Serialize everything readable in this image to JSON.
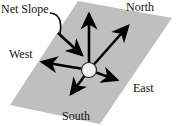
{
  "diagram": {
    "type": "vector-diagram",
    "plane": {
      "name": "sloped-plane-parallelogram",
      "fill_color": "#bfbfbf",
      "points": "78,1 172,18 100,124 10,105"
    },
    "hub": {
      "name": "center-origin-node",
      "cx": 89,
      "cy": 70,
      "r": 7.5,
      "fill_color": "#f2f2f2",
      "stroke_color": "#2b2b2b"
    },
    "arrow_color": "#000000",
    "labels": {
      "net_slope": "Net Slope",
      "north": "North",
      "south": "South",
      "east": "East",
      "west": "West"
    },
    "arrows": [
      {
        "name": "arrow-north",
        "from": [
          89,
          70
        ],
        "to": [
          89,
          9
        ],
        "label": "North"
      },
      {
        "name": "arrow-northeast",
        "from": [
          89,
          70
        ],
        "to": [
          131,
          22
        ],
        "label": ""
      },
      {
        "name": "arrow-east",
        "from": [
          89,
          70
        ],
        "to": [
          124,
          83
        ],
        "label": "East"
      },
      {
        "name": "arrow-south",
        "from": [
          89,
          70
        ],
        "to": [
          67,
          100
        ],
        "label": "South"
      },
      {
        "name": "arrow-west",
        "from": [
          89,
          70
        ],
        "to": [
          34,
          60
        ],
        "label": "West"
      },
      {
        "name": "arrow-net-slope",
        "from": [
          59,
          35
        ],
        "to": [
          88,
          60
        ],
        "label": "Net Slope"
      }
    ],
    "leader_line": {
      "name": "net-slope-leader-curve",
      "path": "M 50 13 C 60 14, 62 22, 60 34"
    }
  }
}
